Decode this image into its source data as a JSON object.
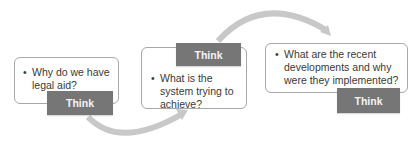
{
  "diagram": {
    "steps": [
      {
        "question": "Why do we have legal aid?",
        "tag": "Think"
      },
      {
        "question": "What is the system trying to achieve?",
        "tag": "Think"
      },
      {
        "question": "What are the recent developments and why were they implemented?",
        "tag": "Think"
      }
    ],
    "bullet_char": "•",
    "colors": {
      "box_border": "#a8a8a8",
      "tag_bg": "#767676",
      "tag_text": "#f4f4f4",
      "arrow": "#c8c8c8",
      "text": "#3a3a3a"
    }
  }
}
